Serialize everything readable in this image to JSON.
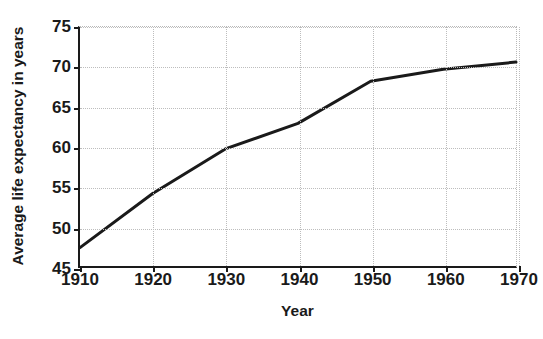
{
  "chart_data": {
    "type": "line",
    "title": "from 1910-1970",
    "xlabel": "Year",
    "ylabel": "Average life expectancy in years",
    "x": [
      1910,
      1920,
      1930,
      1940,
      1950,
      1960,
      1970
    ],
    "series": [
      {
        "name": "Average life expectancy",
        "values": [
          47.3,
          54.1,
          59.7,
          62.9,
          68.2,
          69.7,
          70.6
        ],
        "color": "#1a1a1a"
      }
    ],
    "xlim": [
      1910,
      1970
    ],
    "ylim": [
      45,
      75
    ],
    "xticks": [
      1910,
      1920,
      1930,
      1940,
      1950,
      1960,
      1970
    ],
    "xtick_labels": [
      "1910",
      "1920",
      "1930",
      "1940",
      "1950",
      "1960",
      "1970"
    ],
    "yticks": [
      45,
      50,
      55,
      60,
      65,
      70,
      75
    ],
    "ytick_labels": [
      "45",
      "50",
      "55",
      "60",
      "65",
      "70",
      "75"
    ],
    "grid": true,
    "legend": false,
    "legend_position": "none"
  }
}
